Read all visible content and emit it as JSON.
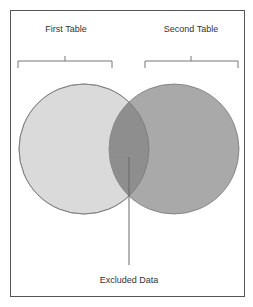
{
  "diagram": {
    "type": "venn",
    "sets": [
      {
        "label": "First Table",
        "color": "#d9d9d9"
      },
      {
        "label": "Second Table",
        "color": "#a6a6a6"
      }
    ],
    "intersection_color": "#8c8c8c",
    "callout": {
      "label": "Excluded Data"
    }
  }
}
